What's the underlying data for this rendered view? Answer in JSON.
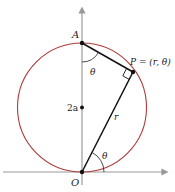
{
  "diagram": {
    "labels": {
      "A": "A",
      "O": "O",
      "P": "P = (r, θ)",
      "two_a": "2a",
      "r": "r",
      "theta_top": "θ",
      "theta_bottom": "θ"
    },
    "colors": {
      "circle": "#b03a3a",
      "axis": "#9a9a9a",
      "segment": "#111111"
    }
  }
}
